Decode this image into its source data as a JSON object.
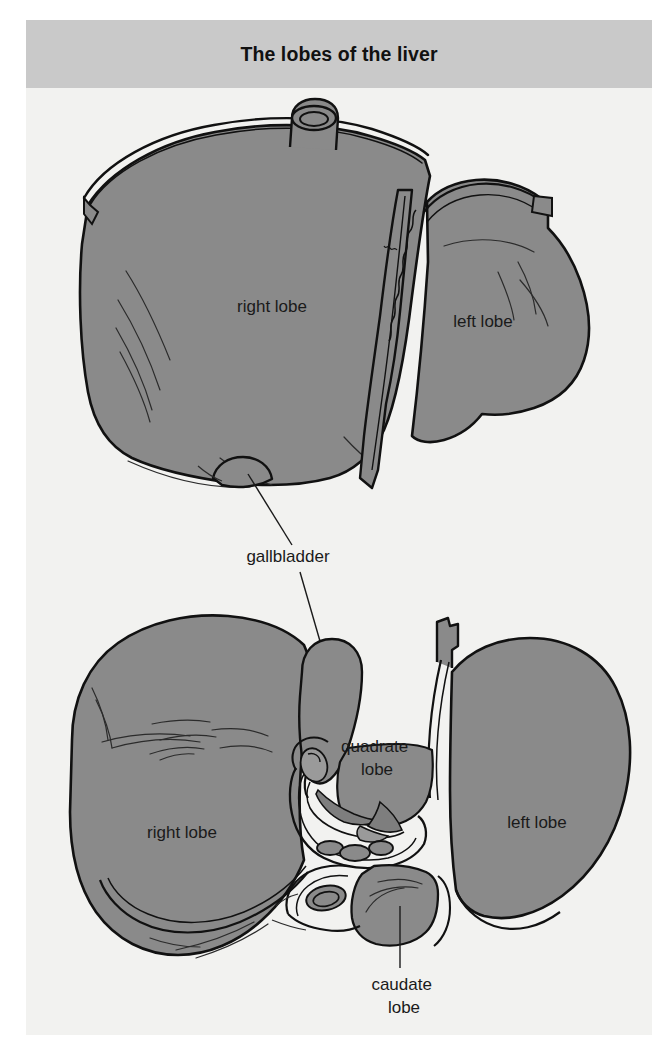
{
  "figure": {
    "title": "The lobes of the liver",
    "background_color": "#f2f2f0",
    "page_color": "#ffffff"
  },
  "header": {
    "title": "The lobes of the liver",
    "band_color": "#c9c9c9",
    "text_color": "#111111"
  },
  "palette": {
    "organ_fill": "#8a8a8a",
    "organ_fill_shadow": "#7e7e7e",
    "organ_fill_light": "#949494",
    "outline": "#111111",
    "detail_line": "#2b2b2b",
    "leader_line": "#1a1a1a"
  },
  "views": [
    {
      "name": "anterior-view",
      "position": "top",
      "description": "Anterior (front) view of the liver",
      "labels": [
        {
          "id": "right-lobe-anterior",
          "text": "right lobe",
          "x": 272,
          "y": 312
        },
        {
          "id": "left-lobe-anterior",
          "text": "left lobe",
          "x": 483,
          "y": 327
        }
      ],
      "structures": [
        "right lobe",
        "left lobe",
        "falciform ligament",
        "inferior vena cava",
        "gallbladder fundus"
      ]
    },
    {
      "name": "inferior-view",
      "position": "bottom",
      "description": "Inferior (visceral) view of the liver",
      "labels": [
        {
          "id": "right-lobe-inferior",
          "text": "right lobe",
          "x": 182,
          "y": 838
        },
        {
          "id": "left-lobe-inferior",
          "text": "left lobe",
          "x": 537,
          "y": 828
        },
        {
          "id": "quadrate-lobe",
          "text": "quadrate\nlobe",
          "line1": "quadrate",
          "line2": "lobe",
          "x": 377,
          "y": 752
        },
        {
          "id": "caudate-lobe",
          "text": "caudate\nlobe",
          "line1": "caudate",
          "line2": "lobe",
          "x": 404,
          "y": 990
        }
      ],
      "structures": [
        "right lobe",
        "left lobe",
        "quadrate lobe",
        "caudate lobe",
        "gallbladder",
        "porta hepatis",
        "hepatic artery",
        "portal vein",
        "bile duct",
        "inferior vena cava",
        "ligamentum teres"
      ]
    }
  ],
  "shared_labels": [
    {
      "id": "gallbladder",
      "text": "gallbladder",
      "x": 288,
      "y": 562,
      "leader_up": "to gallbladder fundus on anterior view",
      "leader_down": "to gallbladder on inferior view"
    }
  ]
}
